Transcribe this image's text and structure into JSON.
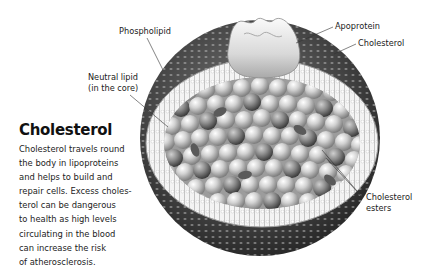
{
  "text_panel": {
    "heading": "Cholesterol",
    "lines": [
      "Cholesterol travels round",
      "the body in lipoproteins",
      "and helps to build and",
      "repair cells. Excess choles-",
      "terol can be dangerous",
      "to health as high levels",
      "circulating in the blood",
      "can increase the risk",
      "of atherosclerosis."
    ]
  },
  "labels": {
    "phospholipid": "Phospholipid",
    "neutral_lipid_line1": "Neutral lipid",
    "neutral_lipid_line2": "(in the core)",
    "apoprotein": "Apoprotein",
    "cholesterol": "Cholesterol",
    "cholesterol_esters_line1": "Cholesterol",
    "cholesterol_esters_line2": "esters"
  },
  "colors": {
    "shell_dark": "#3a3a3a",
    "band_light": "#f2f2f2",
    "core_sphere": "#c9c9c9",
    "text": "#222222"
  }
}
